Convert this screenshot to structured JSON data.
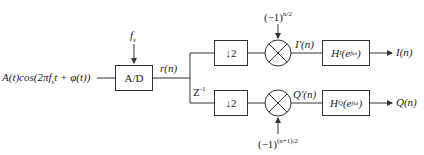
{
  "diagram": {
    "type": "block-diagram",
    "input_signal": "A(t)cos(2πf_s t + φ(t))",
    "input_parts": {
      "main": "A(t)cos(2πf",
      "sub": "s",
      "tail": "t + φ(t))"
    },
    "sampling_freq": {
      "main": "f",
      "sub": "s"
    },
    "adc_block": "A/D",
    "adc_output": "r(n)",
    "delay": {
      "main": "Z",
      "sup": "-1"
    },
    "branches": [
      {
        "name": "I",
        "downsample": "↓2",
        "mixer_input": {
          "main": "(−1)",
          "sup": "n/2"
        },
        "mixer_output": {
          "main": "I'(n)"
        },
        "filter": {
          "main": "H",
          "sub": "I",
          "arg": "(e",
          "arg_sup": "jω",
          "close": ")"
        },
        "output": "I(n)"
      },
      {
        "name": "Q",
        "downsample": "↓2",
        "mixer_input": {
          "main": "(−1)",
          "sup": "(n+1)/2"
        },
        "mixer_output": {
          "main": "Q'(n)"
        },
        "filter": {
          "main": "H",
          "sub": "Q",
          "arg": "(e",
          "arg_sup": "jω",
          "close": ")"
        },
        "output": "Q(n)"
      }
    ]
  },
  "colors": {
    "line": "#333333",
    "background": "#ffffff"
  }
}
